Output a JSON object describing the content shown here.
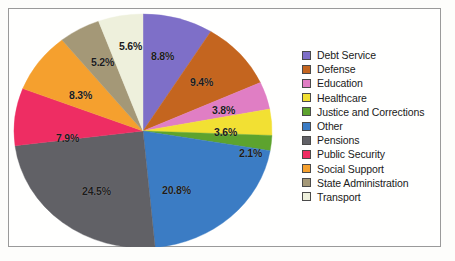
{
  "chart_data": {
    "type": "pie",
    "title": "",
    "legend_position": "right",
    "categories": [
      "Debt Service",
      "Defense",
      "Education",
      "Healthcare",
      "Justice and Corrections",
      "Other",
      "Pensions",
      "Public Security",
      "Social Support",
      "State Administration",
      "Transport"
    ],
    "values": [
      8.8,
      9.4,
      3.8,
      3.6,
      2.1,
      20.8,
      24.5,
      7.9,
      8.3,
      5.2,
      5.6
    ],
    "value_labels": [
      "8.8%",
      "9.4%",
      "3.8%",
      "3.6%",
      "2.1%",
      "20.8%",
      "24.5%",
      "7.9%",
      "8.3%",
      "5.2%",
      "5.6%"
    ],
    "unit": "%",
    "colors": [
      "#7e6fc8",
      "#c4651f",
      "#e07ec4",
      "#f2e033",
      "#5da32e",
      "#3b7cc4",
      "#616166",
      "#ee2d63",
      "#f5a02e",
      "#a49877",
      "#eef0dc"
    ],
    "slice_order_clockwise_from_top": [
      "Debt Service",
      "Defense",
      "Education",
      "Healthcare",
      "Justice and Corrections",
      "Other",
      "Pensions",
      "Public Security",
      "Social Support",
      "State Administration",
      "Transport"
    ]
  },
  "legend": {
    "items": [
      {
        "label": "Debt Service",
        "color": "#7e6fc8"
      },
      {
        "label": "Defense",
        "color": "#c4651f"
      },
      {
        "label": "Education",
        "color": "#e07ec4"
      },
      {
        "label": "Healthcare",
        "color": "#f2e033"
      },
      {
        "label": "Justice and Corrections",
        "color": "#5da32e"
      },
      {
        "label": "Other",
        "color": "#3b7cc4"
      },
      {
        "label": "Pensions",
        "color": "#616166"
      },
      {
        "label": "Public Security",
        "color": "#ee2d63"
      },
      {
        "label": "Social Support",
        "color": "#f5a02e"
      },
      {
        "label": "State Administration",
        "color": "#a49877"
      },
      {
        "label": "Transport",
        "color": "#eef0dc"
      }
    ]
  },
  "slice_labels": [
    {
      "text": "8.8%",
      "x": 142,
      "y": 41
    },
    {
      "text": "9.4%",
      "x": 181,
      "y": 67
    },
    {
      "text": "3.8%",
      "x": 203,
      "y": 95
    },
    {
      "text": "3.6%",
      "x": 205,
      "y": 117
    },
    {
      "text": "2.1%",
      "x": 230,
      "y": 138
    },
    {
      "text": "20.8%",
      "x": 153,
      "y": 175
    },
    {
      "text": "24.5%",
      "x": 73,
      "y": 176
    },
    {
      "text": "7.9%",
      "x": 47,
      "y": 123
    },
    {
      "text": "8.3%",
      "x": 60,
      "y": 80
    },
    {
      "text": "5.2%",
      "x": 82,
      "y": 47
    },
    {
      "text": "5.6%",
      "x": 110,
      "y": 31
    }
  ]
}
